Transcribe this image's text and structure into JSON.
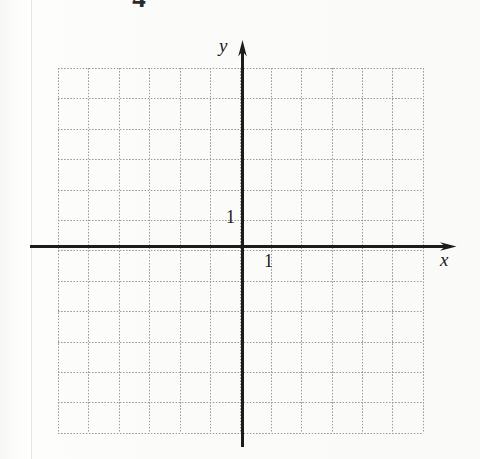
{
  "page": {
    "width": 480,
    "height": 459,
    "background_color": "#fbfbfa",
    "paper_edge_color": "#e6e6e4",
    "cropped_top_glyph": "4"
  },
  "chart_data": {
    "type": "scatter",
    "title": "",
    "subtitle": "",
    "xlabel": "x",
    "ylabel": "y",
    "series": [
      {
        "name": "",
        "x": [],
        "y": []
      }
    ],
    "x": [],
    "values": [],
    "categories": [],
    "xlim": [
      -6,
      6
    ],
    "ylim": [
      -6,
      6
    ],
    "x_tick_labels": [
      "1"
    ],
    "y_tick_labels": [
      "1"
    ],
    "x_ticks": [
      1
    ],
    "y_ticks": [
      1
    ],
    "grid": true,
    "grid_style": "dotted",
    "grid_color": "#9a9a9a",
    "grid_columns": 12,
    "grid_rows": 12,
    "grid_spacing_px": 30.4,
    "legend": false,
    "legend_position": "none",
    "axis_color": "#1c1c1c",
    "axis_arrows": [
      "x-positive",
      "y-positive"
    ],
    "origin_label": "",
    "annotations": []
  },
  "axes": {
    "x": {
      "name": "x",
      "unit_label": "1",
      "arrow_icon": "arrow-right-icon"
    },
    "y": {
      "name": "y",
      "unit_label": "1",
      "arrow_icon": "arrow-up-icon"
    }
  }
}
